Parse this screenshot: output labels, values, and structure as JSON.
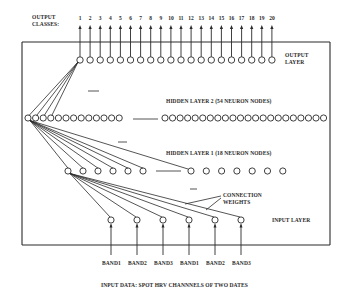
{
  "labels": {
    "output_classes_line1": "OUTPUT",
    "output_classes_line2": "CLASSES:",
    "output_layer_line1": "OUTPUT",
    "output_layer_line2": "LAYER",
    "hidden_layer_2": "HIDDEN LAYER 2   (54 NEURON NODES)",
    "hidden_layer_1": "HIDDEN LAYER 1   (18 NEURON NODES)",
    "connection_weights_line1": "CONNECTION",
    "connection_weights_line2": "WEIGHTS",
    "input_layer": "INPUT LAYER",
    "input_data": "INPUT DATA: SPOT HRV CHANNNELS OF TWO DATES"
  },
  "output_classes": [
    "1",
    "2",
    "3",
    "4",
    "5",
    "6",
    "7",
    "8",
    "9",
    "10",
    "11",
    "12",
    "13",
    "14",
    "15",
    "16",
    "17",
    "18",
    "19",
    "20"
  ],
  "input_bands": [
    "BAND1",
    "BAND2",
    "BAND3",
    "BAND1",
    "BAND2",
    "BAND3"
  ],
  "layers": {
    "output": {
      "nodes": 20
    },
    "hidden_2": {
      "nodes": 54
    },
    "hidden_1": {
      "nodes": 18
    },
    "input": {
      "nodes": 6
    }
  },
  "colors": {
    "ink": "#2a2a2a",
    "background": "#ffffff"
  }
}
